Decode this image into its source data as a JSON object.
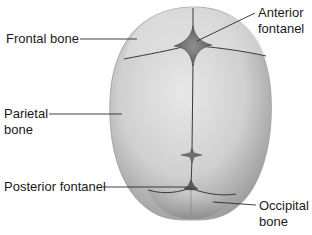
{
  "diagram": {
    "labels": {
      "frontal_bone": "Frontal bone",
      "anterior_fontanel_line1": "Anterior",
      "anterior_fontanel_line2": "fontanel",
      "parietal_bone_line1": "Parietal",
      "parietal_bone_line2": "bone",
      "posterior_fontanel": "Posterior fontanel",
      "occipital_bone_line1": "Occipital",
      "occipital_bone_line2": "bone"
    },
    "colors": {
      "background": "#ffffff",
      "bone_light": "#e4e4e4",
      "bone_mid": "#c4c4c4",
      "bone_dark": "#8e8e8e",
      "fontanel": "#7a7a7a",
      "suture": "#3a3a3a",
      "leader_line": "#2a2a2a",
      "text": "#1a1a1a"
    }
  }
}
